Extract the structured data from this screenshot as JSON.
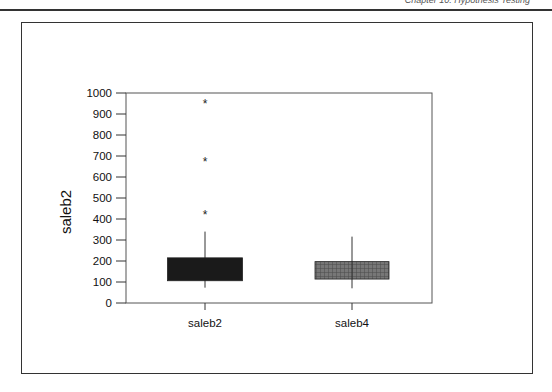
{
  "page": {
    "running_header": "Chapter 10: Hypothesis Testing"
  },
  "chart_data": {
    "type": "boxplot",
    "title": "",
    "xlabel": "",
    "ylabel": "saleb2",
    "ylim": [
      0,
      1000
    ],
    "yticks": [
      0,
      100,
      200,
      300,
      400,
      500,
      600,
      700,
      800,
      900,
      1000
    ],
    "grid": false,
    "legend": null,
    "categories": [
      "saleb2",
      "saleb4"
    ],
    "series": [
      {
        "name": "saleb2",
        "whisker_low": 73,
        "q1": 106,
        "q3": 215,
        "whisker_high": 340,
        "outliers": [
          422,
          678,
          954
        ],
        "fill": "#1a1a1a",
        "pattern": "solid"
      },
      {
        "name": "saleb4",
        "whisker_low": 70,
        "q1": 114,
        "q3": 197,
        "whisker_high": 316,
        "outliers": [],
        "fill": "#6e6e6e",
        "pattern": "crosshatch"
      }
    ]
  }
}
